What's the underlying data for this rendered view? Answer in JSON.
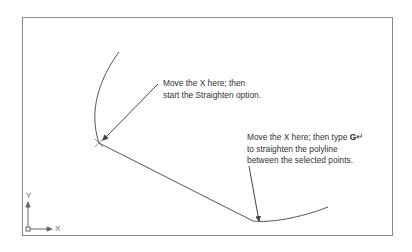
{
  "callouts": {
    "start_point": {
      "line1": "Move the X here; then",
      "line2": "start the Straighten option."
    },
    "end_point": {
      "line1_prefix": "Move the X here; then type ",
      "key": "G",
      "enter_glyph": "↵",
      "line2": "to straighten the polyline",
      "line3": "between the selected points."
    }
  },
  "ucs_icon": {
    "x_label": "X",
    "y_label": "Y"
  },
  "colors": {
    "line": "#555555",
    "frame": "#8a8a8a",
    "text": "#333333"
  }
}
